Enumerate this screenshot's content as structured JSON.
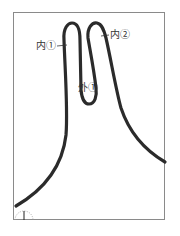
{
  "diagram": {
    "labels": {
      "inner1": "内①",
      "inner2": "内②",
      "outer1": "外①"
    },
    "colors": {
      "curve": "#2b2b2b",
      "frame": "#8a8a8a",
      "text": "#333333"
    },
    "marker": {
      "type": "dashed-semicircle-with-tick",
      "position": "bottom-left"
    }
  }
}
